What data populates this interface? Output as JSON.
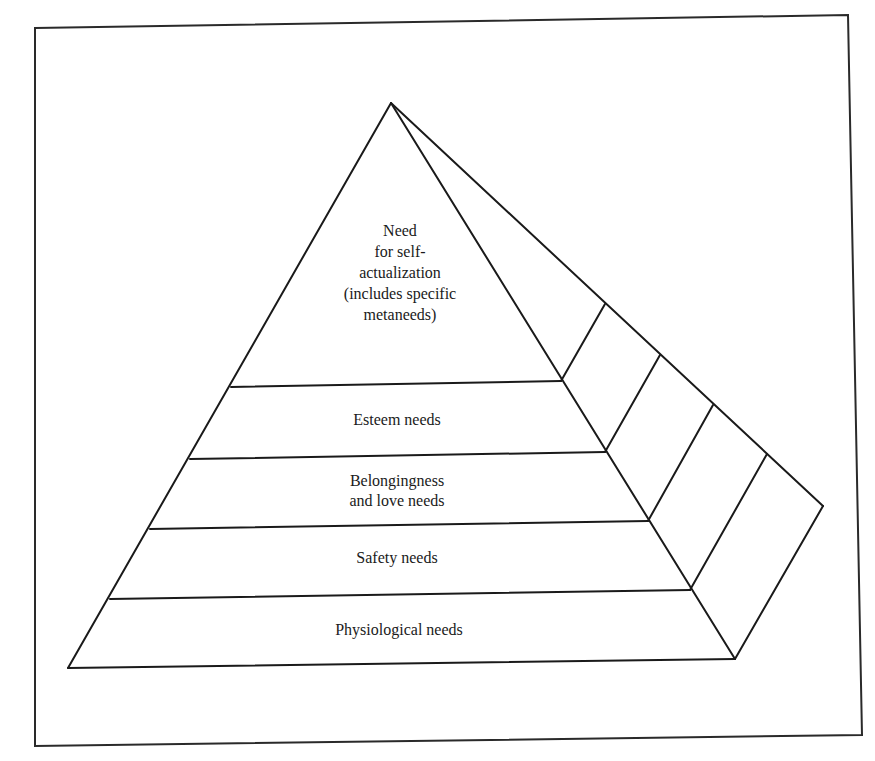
{
  "diagram": {
    "colors": {
      "line": "#1a1a1a",
      "background": "#ffffff"
    },
    "levels": [
      {
        "id": "self-actualization",
        "lines": [
          "Need",
          "for self-",
          "actualization",
          "(includes specific",
          "metaneeds)"
        ]
      },
      {
        "id": "esteem",
        "lines": [
          "Esteem needs"
        ]
      },
      {
        "id": "belongingness",
        "lines": [
          "Belongingness",
          "and love needs"
        ]
      },
      {
        "id": "safety",
        "lines": [
          "Safety needs"
        ]
      },
      {
        "id": "physiological",
        "lines": [
          "Physiological needs"
        ]
      }
    ]
  }
}
